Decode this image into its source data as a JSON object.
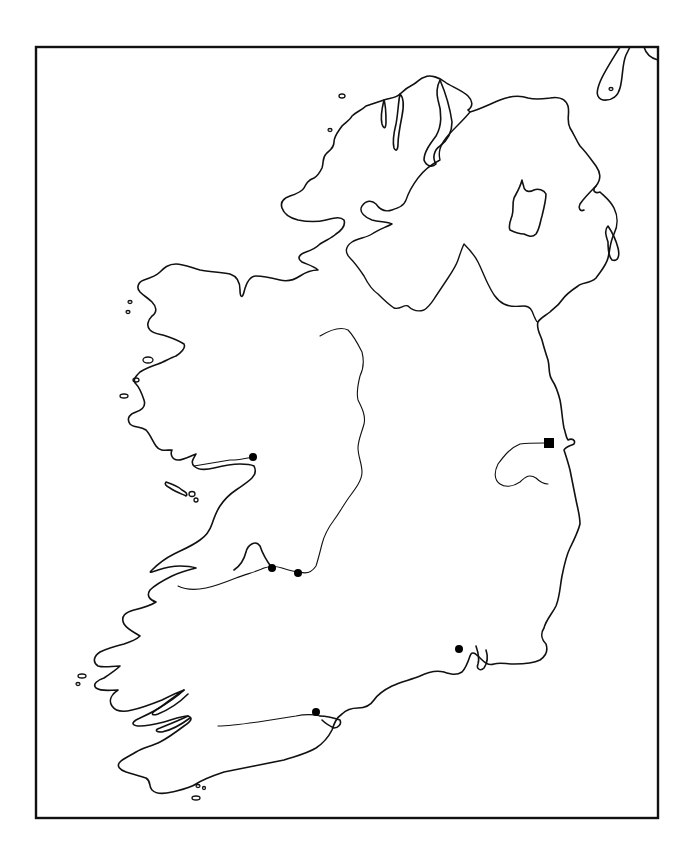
{
  "map": {
    "type": "outline-map",
    "region": "Ireland",
    "frame": {
      "x": 36,
      "y": 47,
      "width": 622,
      "height": 771
    },
    "colors": {
      "line": "#111111",
      "background": "#ffffff",
      "marker": "#000000"
    },
    "markers": {
      "squares": [
        {
          "id": "square-1",
          "x": 549,
          "y": 443,
          "size": 10
        }
      ],
      "dots": [
        {
          "id": "dot-1",
          "x": 253,
          "y": 457,
          "r": 4
        },
        {
          "id": "dot-2",
          "x": 272,
          "y": 568,
          "r": 4
        },
        {
          "id": "dot-3",
          "x": 298,
          "y": 573,
          "r": 4
        },
        {
          "id": "dot-4",
          "x": 459,
          "y": 649,
          "r": 4
        },
        {
          "id": "dot-5",
          "x": 316,
          "y": 712,
          "r": 4
        }
      ]
    },
    "labels": []
  }
}
